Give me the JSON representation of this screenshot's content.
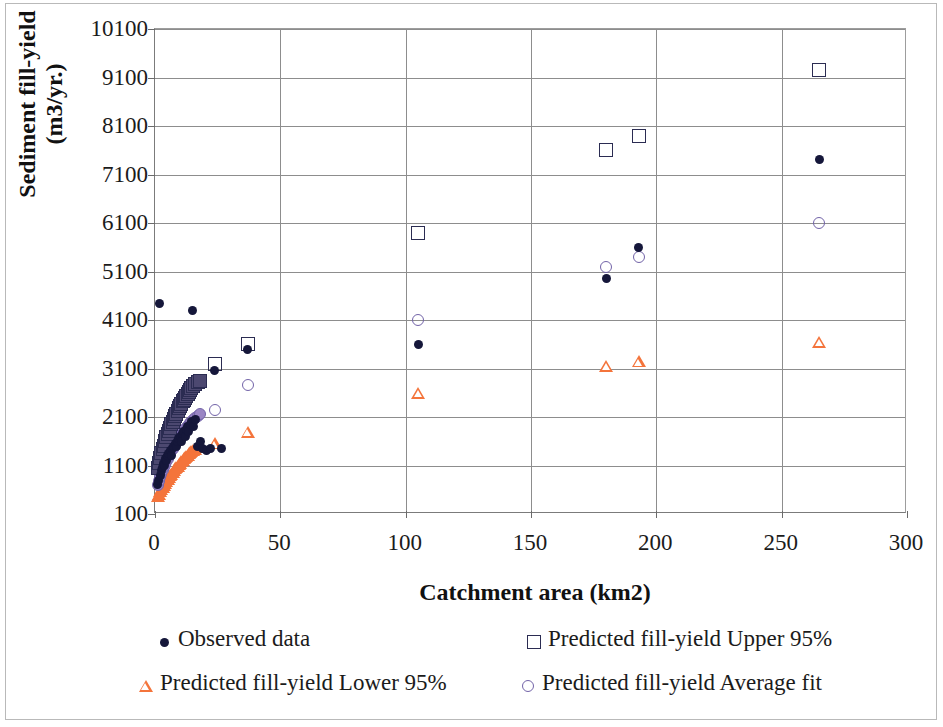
{
  "chart_data": {
    "type": "scatter",
    "title": "",
    "xlabel": "Catchment area (km2)",
    "ylabel": "Sediment fill-yield  (m3/yr.)",
    "xlim": [
      0,
      300
    ],
    "ylim": [
      100,
      10100
    ],
    "xticks": [
      0,
      50,
      100,
      150,
      200,
      250,
      300
    ],
    "yticks": [
      100,
      1100,
      2100,
      3100,
      4100,
      5100,
      6100,
      7100,
      8100,
      9100,
      10100
    ],
    "grid": true,
    "legend_position": "bottom",
    "colors": {
      "observed": "#15173a",
      "upper95": "#2b2c52",
      "lower95": "#f4743b",
      "average": "#7263a8",
      "gridline": "#8d8d8d",
      "axis": "#6a6a6a",
      "border": "#b9b9b9"
    },
    "series": [
      {
        "name": "Observed data",
        "marker": "filled-circle",
        "color": "#15173a",
        "points": [
          [
            1.0,
            700
          ],
          [
            1.4,
            800
          ],
          [
            1.8,
            4450
          ],
          [
            2.2,
            900
          ],
          [
            2.6,
            1000
          ],
          [
            3.0,
            1050
          ],
          [
            3.4,
            1150
          ],
          [
            3.8,
            1100
          ],
          [
            4.2,
            1250
          ],
          [
            4.6,
            1200
          ],
          [
            5.0,
            1300
          ],
          [
            5.5,
            1350
          ],
          [
            6.0,
            1400
          ],
          [
            6.5,
            1300
          ],
          [
            7.0,
            1450
          ],
          [
            7.5,
            1500
          ],
          [
            8.0,
            1550
          ],
          [
            8.5,
            1500
          ],
          [
            9.0,
            1600
          ],
          [
            9.5,
            1650
          ],
          [
            10.0,
            1700
          ],
          [
            10.5,
            1600
          ],
          [
            11.0,
            1750
          ],
          [
            11.5,
            1800
          ],
          [
            12.0,
            1700
          ],
          [
            12.5,
            1850
          ],
          [
            13.0,
            1900
          ],
          [
            13.5,
            1800
          ],
          [
            14.0,
            1950
          ],
          [
            14.5,
            2000
          ],
          [
            15.0,
            4300
          ],
          [
            15.5,
            1900
          ],
          [
            16.0,
            2050
          ],
          [
            17.0,
            1500
          ],
          [
            18.0,
            1600
          ],
          [
            19.0,
            1450
          ],
          [
            20.5,
            1400
          ],
          [
            22.0,
            1450
          ],
          [
            23.8,
            3050
          ],
          [
            26.5,
            1450
          ],
          [
            37.0,
            3500
          ],
          [
            105.0,
            3600
          ],
          [
            180.0,
            4950
          ],
          [
            193.0,
            5600
          ],
          [
            265.0,
            7400
          ]
        ]
      },
      {
        "name": "Predicted fill-yield Upper 95%",
        "marker": "open-square",
        "color": "#2b2c52",
        "points": [
          [
            1.0,
            1050
          ],
          [
            1.5,
            1150
          ],
          [
            2.0,
            1250
          ],
          [
            2.5,
            1350
          ],
          [
            3.0,
            1450
          ],
          [
            3.5,
            1500
          ],
          [
            4.0,
            1600
          ],
          [
            4.5,
            1680
          ],
          [
            5.0,
            1750
          ],
          [
            5.5,
            1820
          ],
          [
            6.0,
            1880
          ],
          [
            6.5,
            1950
          ],
          [
            7.0,
            2000
          ],
          [
            7.5,
            2060
          ],
          [
            8.0,
            2120
          ],
          [
            8.5,
            2170
          ],
          [
            9.0,
            2220
          ],
          [
            9.5,
            2280
          ],
          [
            10.0,
            2320
          ],
          [
            10.5,
            2370
          ],
          [
            11.0,
            2420
          ],
          [
            11.5,
            2460
          ],
          [
            12.0,
            2500
          ],
          [
            12.5,
            2540
          ],
          [
            13.0,
            2580
          ],
          [
            13.5,
            2620
          ],
          [
            14.0,
            2660
          ],
          [
            14.5,
            2700
          ],
          [
            15.0,
            2730
          ],
          [
            16.0,
            2780
          ],
          [
            17.0,
            2820
          ],
          [
            18.0,
            2850
          ],
          [
            23.8,
            3200
          ],
          [
            37.0,
            3600
          ],
          [
            105.0,
            5900
          ],
          [
            180.0,
            7600
          ],
          [
            193.0,
            7900
          ],
          [
            265.0,
            9250
          ]
        ]
      },
      {
        "name": "Predicted fill-yield Lower 95%",
        "marker": "open-triangle",
        "color": "#f4743b",
        "points": [
          [
            1.0,
            480
          ],
          [
            1.5,
            520
          ],
          [
            2.0,
            570
          ],
          [
            2.5,
            620
          ],
          [
            3.0,
            660
          ],
          [
            3.5,
            700
          ],
          [
            4.0,
            740
          ],
          [
            4.5,
            780
          ],
          [
            5.0,
            820
          ],
          [
            5.5,
            860
          ],
          [
            6.0,
            900
          ],
          [
            6.5,
            930
          ],
          [
            7.0,
            970
          ],
          [
            7.5,
            1000
          ],
          [
            8.0,
            1040
          ],
          [
            8.5,
            1070
          ],
          [
            9.0,
            1100
          ],
          [
            9.5,
            1130
          ],
          [
            10.0,
            1160
          ],
          [
            10.5,
            1190
          ],
          [
            11.0,
            1220
          ],
          [
            11.5,
            1250
          ],
          [
            12.0,
            1270
          ],
          [
            12.5,
            1300
          ],
          [
            13.0,
            1320
          ],
          [
            13.5,
            1350
          ],
          [
            14.0,
            1370
          ],
          [
            14.5,
            1390
          ],
          [
            15.0,
            1410
          ],
          [
            16.0,
            1450
          ],
          [
            17.0,
            1480
          ],
          [
            18.0,
            1510
          ],
          [
            23.8,
            1560
          ],
          [
            37.0,
            1800
          ],
          [
            105.0,
            2600
          ],
          [
            180.0,
            3150
          ],
          [
            193.0,
            3250
          ],
          [
            265.0,
            3650
          ]
        ]
      },
      {
        "name": "Predicted fill-yield Average fit",
        "marker": "open-circle",
        "color": "#7263a8",
        "points": [
          [
            1.0,
            700
          ],
          [
            1.5,
            780
          ],
          [
            2.0,
            860
          ],
          [
            2.5,
            930
          ],
          [
            3.0,
            1000
          ],
          [
            3.5,
            1060
          ],
          [
            4.0,
            1120
          ],
          [
            4.5,
            1180
          ],
          [
            5.0,
            1240
          ],
          [
            5.5,
            1290
          ],
          [
            6.0,
            1340
          ],
          [
            6.5,
            1390
          ],
          [
            7.0,
            1440
          ],
          [
            7.5,
            1480
          ],
          [
            8.0,
            1520
          ],
          [
            8.5,
            1570
          ],
          [
            9.0,
            1610
          ],
          [
            9.5,
            1650
          ],
          [
            10.0,
            1690
          ],
          [
            10.5,
            1730
          ],
          [
            11.0,
            1770
          ],
          [
            11.5,
            1800
          ],
          [
            12.0,
            1840
          ],
          [
            12.5,
            1870
          ],
          [
            13.0,
            1910
          ],
          [
            13.5,
            1940
          ],
          [
            14.0,
            1970
          ],
          [
            14.5,
            2000
          ],
          [
            15.0,
            2030
          ],
          [
            16.0,
            2080
          ],
          [
            17.0,
            2130
          ],
          [
            18.0,
            2170
          ],
          [
            23.8,
            2250
          ],
          [
            37.0,
            2750
          ],
          [
            105.0,
            4100
          ],
          [
            180.0,
            5200
          ],
          [
            193.0,
            5400
          ],
          [
            265.0,
            6100
          ]
        ]
      }
    ]
  },
  "legend": {
    "entries": [
      {
        "label": "Observed data",
        "marker": "filled-circle"
      },
      {
        "label": "Predicted fill-yield Upper 95%",
        "marker": "open-square"
      },
      {
        "label": "Predicted fill-yield Lower 95%",
        "marker": "open-triangle"
      },
      {
        "label": "Predicted fill-yield Average fit",
        "marker": "open-circle"
      }
    ]
  }
}
